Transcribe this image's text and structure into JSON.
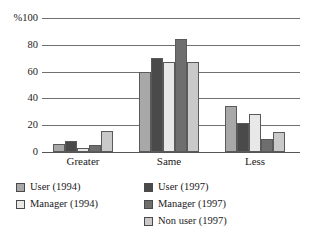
{
  "chart_data": {
    "type": "bar",
    "title": "",
    "xlabel": "",
    "ylabel": "%",
    "ylim": [
      0,
      100
    ],
    "yticks": [
      0,
      20,
      40,
      60,
      80,
      100
    ],
    "ytick_labels": [
      "0",
      "20",
      "40",
      "60",
      "80",
      "%100"
    ],
    "grid": true,
    "legend_position": "below",
    "categories": [
      "Greater",
      "Same",
      "Less"
    ],
    "series": [
      {
        "name": "User (1994)",
        "values": [
          6,
          60,
          34
        ],
        "color": "#a8a8a8"
      },
      {
        "name": "Manager (1994)",
        "values": [
          3,
          67,
          28
        ],
        "color": "#e8e8e8"
      },
      {
        "name": "User (1997)",
        "values": [
          8,
          70,
          22
        ],
        "color": "#4a4a4a"
      },
      {
        "name": "Manager (1997)",
        "values": [
          5,
          84,
          10
        ],
        "color": "#6e6e6e"
      },
      {
        "name": "Non user (1997)",
        "values": [
          16,
          67,
          15
        ],
        "color": "#c9c9c9"
      }
    ],
    "bar_order": [
      "User (1994)",
      "User (1997)",
      "Manager (1994)",
      "Manager (1997)",
      "Non user (1997)"
    ],
    "legend": [
      {
        "label": "User (1994)",
        "color": "#a8a8a8",
        "row": 0,
        "col": "left"
      },
      {
        "label": "Manager (1994)",
        "color": "#e8e8e8",
        "row": 1,
        "col": "left"
      },
      {
        "label": "User (1997)",
        "color": "#4a4a4a",
        "row": 0,
        "col": "right"
      },
      {
        "label": "Manager (1997)",
        "color": "#6e6e6e",
        "row": 1,
        "col": "right"
      },
      {
        "label": "Non user (1997)",
        "color": "#c9c9c9",
        "row": 2,
        "col": "right"
      }
    ],
    "axis_color": "#707070"
  }
}
